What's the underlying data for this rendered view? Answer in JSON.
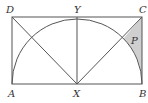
{
  "diagram": {
    "points": {
      "A": {
        "label": "A",
        "x": 12,
        "y": 84
      },
      "B": {
        "label": "B",
        "x": 142,
        "y": 84
      },
      "C": {
        "label": "C",
        "x": 142,
        "y": 17
      },
      "D": {
        "label": "D",
        "x": 12,
        "y": 17
      },
      "X": {
        "label": "X",
        "x": 77,
        "y": 84
      },
      "Y": {
        "label": "Y",
        "x": 77,
        "y": 17
      }
    },
    "region": {
      "label": "P",
      "fill": "#cfcfcf"
    },
    "segments": [
      "AB",
      "BC",
      "CD",
      "DA",
      "XY",
      "XD",
      "XC"
    ],
    "arc": {
      "center": "X",
      "radius": 65,
      "from": "A",
      "to": "B"
    },
    "colors": {
      "stroke": "#555555",
      "label": "#333333",
      "shade": "#cfcfcf"
    }
  }
}
